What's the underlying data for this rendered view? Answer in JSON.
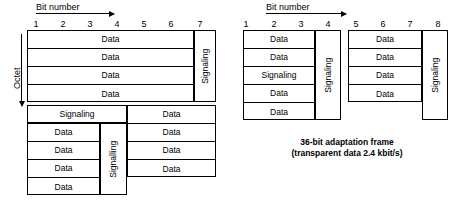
{
  "left_diagram": {
    "axis_label": "Bit number",
    "side_label": "Octet",
    "bit_numbers": [
      "1",
      "2",
      "3",
      "4",
      "5",
      "6",
      "7"
    ],
    "upper_block": {
      "data_rows": [
        "Data",
        "Data",
        "Data",
        "Data"
      ],
      "signaling_column": "Signaling"
    },
    "lower_block": {
      "full_width_row": "Signaling",
      "left_rows": [
        "Data",
        "Data",
        "Data",
        "Data"
      ],
      "middle_signaling_column": "Signalling",
      "right_rows": [
        "Data",
        "Data",
        "Data",
        "Data"
      ]
    },
    "caption": ""
  },
  "right_diagram": {
    "axis_label": "Bit number",
    "bit_numbers": [
      "1",
      "2",
      "3",
      "4",
      "5",
      "6",
      "7",
      "8"
    ],
    "left_group": {
      "rows": [
        "Data",
        "Data",
        "Signaling",
        "Data",
        "Data"
      ],
      "signaling_column": "Signaling"
    },
    "right_group": {
      "rows": [
        "Data",
        "Data",
        "Data",
        "Data"
      ],
      "signaling_column": "Signaling"
    },
    "caption_line1": "36-bit adaptation frame",
    "caption_line2": "(transparent data 2.4 kbit/s)"
  }
}
